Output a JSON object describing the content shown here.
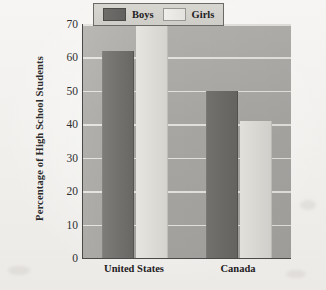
{
  "chart_data": {
    "type": "bar",
    "title": "",
    "subtitle": "",
    "xlabel": "",
    "ylabel": "Percentage of High School Students",
    "categories": [
      "United States",
      "Canada"
    ],
    "series": [
      {
        "name": "Boys",
        "values": [
          62,
          50
        ]
      },
      {
        "name": "Girls",
        "values": [
          70,
          41
        ]
      }
    ],
    "ylim": [
      0,
      70
    ],
    "yticks": [
      0,
      10,
      20,
      30,
      40,
      50,
      60,
      70
    ],
    "ytick_labels": [
      "0",
      "10",
      "20",
      "30",
      "40",
      "50",
      "60",
      "70"
    ],
    "grid": true,
    "grid_axis": "y",
    "legend_position": "top-right-inside",
    "legend_entries": [
      "Boys",
      "Girls"
    ],
    "colors": {
      "boys": "#6e6c68",
      "girls": "#e0ded9",
      "plot_background": "#a9a7a3",
      "gridline": "#e9e8e4",
      "axis": "#4a4a48",
      "page_background": "#f2f1ef",
      "text": "#23211f"
    }
  },
  "axes": {
    "y_title": "Percentage of High School Students"
  },
  "legend": {
    "entries": [
      {
        "label": "Boys",
        "swatch": "boys-swatch"
      },
      {
        "label": "Girls",
        "swatch": "girls-swatch"
      }
    ]
  }
}
